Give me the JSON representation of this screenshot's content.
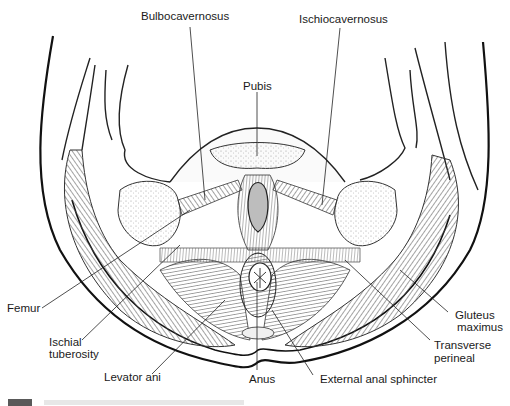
{
  "figure": {
    "labels": {
      "bulbocavernosus": "Bulbocavernosus",
      "ischiocavernosus": "Ischiocavernosus",
      "pubis": "Pubis",
      "femur": "Femur",
      "ischial_tuberosity_1": "Ischial",
      "ischial_tuberosity_2": "tuberosity",
      "levator_ani": "Levator ani",
      "anus": "Anus",
      "external_anal_sphincter": "External anal sphincter",
      "gluteus_maximus_1": "Gluteus",
      "gluteus_maximus_2": "maximus",
      "transverse_perineal_1": "Transverse",
      "transverse_perineal_2": "perineal"
    },
    "colors": {
      "ink": "#1a1a1a",
      "muscle_hatch": "#6b6b6b",
      "bone": "#f4f4f4",
      "background": "#ffffff"
    }
  }
}
